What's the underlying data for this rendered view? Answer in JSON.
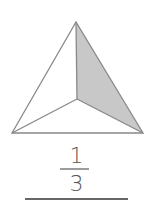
{
  "figure": {
    "shape": "triangle divided into three equal parts from center",
    "shaded_parts": 1,
    "total_parts": 3,
    "shade_color": "#c8c8c8",
    "stroke_color": "#888888"
  },
  "fraction": {
    "numerator": "1",
    "denominator": "3"
  }
}
